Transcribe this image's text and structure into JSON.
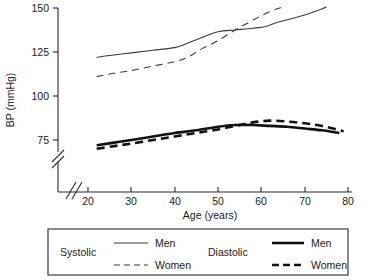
{
  "chart_data": {
    "type": "line",
    "title": "",
    "xlabel": "Age (years)",
    "ylabel": "BP (mmHg)",
    "xlim": [
      20,
      80
    ],
    "ylim": [
      68,
      152
    ],
    "xticks": [
      20,
      30,
      40,
      50,
      60,
      70,
      80
    ],
    "yticks": [
      75,
      100,
      125,
      150
    ],
    "xtick_labels": [
      "20",
      "30",
      "40",
      "50",
      "60",
      "70",
      "80"
    ],
    "ytick_labels": [
      "75",
      "100",
      "125",
      "150"
    ],
    "grid": false,
    "axis_break_x": true,
    "axis_break_y": true,
    "legend_position": "below",
    "series": [
      {
        "name": "Systolic Men",
        "group": "Systolic",
        "sex": "Men",
        "style": "thin-solid",
        "x": [
          22,
          25,
          30,
          35,
          40,
          42,
          45,
          50,
          54,
          58,
          61,
          64,
          70,
          75
        ],
        "values": [
          122,
          123,
          124.5,
          126,
          127.5,
          129,
          132,
          136.5,
          137.5,
          138.5,
          139.5,
          142,
          146,
          150.5
        ]
      },
      {
        "name": "Systolic Women",
        "group": "Systolic",
        "sex": "Women",
        "style": "thin-dashed",
        "x": [
          22,
          25,
          30,
          35,
          40,
          43,
          46,
          50,
          54,
          58,
          62,
          65
        ],
        "values": [
          111,
          112.5,
          114.5,
          117,
          119.5,
          122,
          126.5,
          131.5,
          137.5,
          143,
          148,
          150.5
        ]
      },
      {
        "name": "Diastolic Men",
        "group": "Diastolic",
        "sex": "Men",
        "style": "thick-solid",
        "x": [
          22,
          26,
          30,
          35,
          40,
          45,
          50,
          54,
          58,
          62,
          66,
          70,
          74,
          78
        ],
        "values": [
          72,
          73.5,
          75,
          77,
          79,
          80.5,
          82.5,
          83.5,
          83.5,
          83,
          82.5,
          81.5,
          80.5,
          79
        ]
      },
      {
        "name": "Diastolic Women",
        "group": "Diastolic",
        "sex": "Women",
        "style": "thick-dashed",
        "x": [
          22,
          26,
          30,
          35,
          40,
          45,
          50,
          54,
          58,
          62,
          66,
          70,
          74,
          79
        ],
        "values": [
          70,
          71.5,
          73,
          75,
          77,
          79,
          81,
          83,
          85,
          86,
          85.5,
          84.5,
          83,
          80
        ]
      }
    ]
  },
  "axes": {
    "y_title": "BP (mmHg)",
    "x_title": "Age (years)",
    "y_ticks": [
      "150",
      "125",
      "100",
      "75"
    ],
    "x_ticks": [
      "20",
      "30",
      "40",
      "50",
      "60",
      "70",
      "80"
    ]
  },
  "legend": {
    "systolic_label": "Systolic",
    "diastolic_label": "Diastolic",
    "systolic_men": "Men",
    "systolic_women": "Women",
    "diastolic_men": "Men",
    "diastolic_women": "Women"
  },
  "colors": {
    "systolic_stroke": "#3a3a3a",
    "diastolic_stroke": "#111111",
    "axis": "#2b2b2b",
    "background": "#ffffff"
  }
}
